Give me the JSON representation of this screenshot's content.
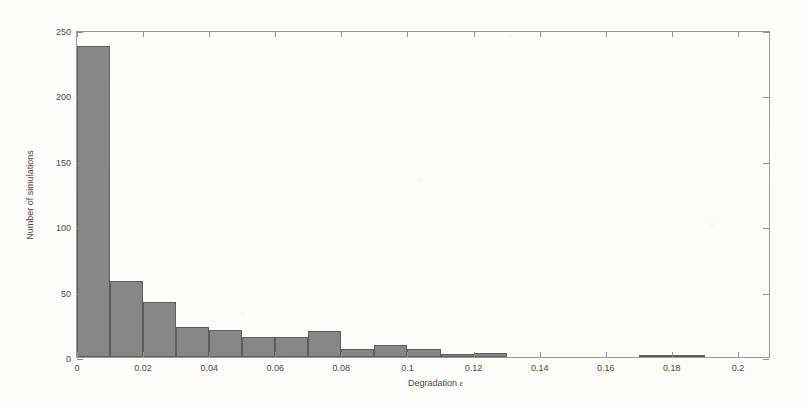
{
  "chart_data": {
    "type": "bar",
    "title": "",
    "subtitle": "",
    "xlabel": "Degradation",
    "xlabel_symbol": "ε",
    "ylabel": "Number of simulations",
    "xlim": [
      0,
      0.21
    ],
    "ylim": [
      0,
      250
    ],
    "grid": false,
    "legend": null,
    "bin_width": 0.01,
    "bar_color": "#878787",
    "bar_edge_color": "#5d5d5d",
    "axis_color": "#9a9a9a",
    "background_color": "#fdfdfc",
    "x_tick_labels": [
      "0",
      "0.02",
      "0.04",
      "0.06",
      "0.08",
      "0.1",
      "0.12",
      "0.14",
      "0.16",
      "0.18",
      "0.2"
    ],
    "x_tick_values": [
      0,
      0.02,
      0.04,
      0.06,
      0.08,
      0.1,
      0.12,
      0.14,
      0.16,
      0.18,
      0.2
    ],
    "y_tick_labels": [
      "0",
      "50",
      "100",
      "150",
      "200",
      "250"
    ],
    "y_tick_values": [
      0,
      50,
      100,
      150,
      200,
      250
    ],
    "bin_edges": [
      0.0,
      0.01,
      0.02,
      0.03,
      0.04,
      0.05,
      0.06,
      0.07,
      0.08,
      0.09,
      0.1,
      0.11,
      0.12,
      0.13,
      0.14,
      0.15,
      0.16,
      0.17,
      0.18,
      0.19,
      0.2,
      0.21
    ],
    "categories": [
      "0.00-0.01",
      "0.01-0.02",
      "0.02-0.03",
      "0.03-0.04",
      "0.04-0.05",
      "0.05-0.06",
      "0.06-0.07",
      "0.07-0.08",
      "0.08-0.09",
      "0.09-0.10",
      "0.10-0.11",
      "0.11-0.12",
      "0.12-0.13",
      "0.13-0.14",
      "0.14-0.15",
      "0.15-0.16",
      "0.16-0.17",
      "0.17-0.18",
      "0.18-0.19",
      "0.19-0.20",
      "0.20-0.21"
    ],
    "values": [
      238,
      58,
      42,
      23,
      21,
      15,
      15,
      20,
      6,
      9,
      6,
      2,
      3,
      0,
      0,
      0,
      0,
      1,
      1,
      0,
      0
    ]
  }
}
